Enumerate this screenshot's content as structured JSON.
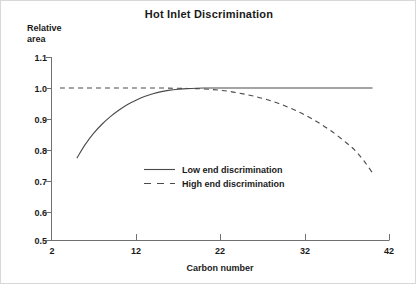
{
  "chart_data": {
    "type": "line",
    "title": "Hot Inlet Discrimination",
    "xlabel": "Carbon number",
    "ylabel": "Relative area",
    "ylabel_line1": "Relative",
    "ylabel_line2": "area",
    "xlim": [
      2,
      42
    ],
    "ylim": [
      0.5,
      1.1
    ],
    "xticks": [
      2,
      12,
      22,
      32,
      42
    ],
    "xtick_labels": [
      "2",
      "12",
      "22",
      "32",
      "42"
    ],
    "yticks": [
      0.5,
      0.6,
      0.7,
      0.8,
      0.9,
      1.0,
      1.1
    ],
    "ytick_labels": [
      "0.5",
      "0.6",
      "0.7",
      "0.8",
      "0.9",
      "1.0",
      "1.1"
    ],
    "grid": false,
    "legend_position": "center",
    "series": [
      {
        "name": "Low end discrimination",
        "style": "solid",
        "color": "#4a4a4a",
        "x": [
          5,
          6,
          7,
          8,
          9,
          10,
          11,
          12,
          13,
          14,
          15,
          16,
          17,
          18,
          20,
          22,
          25,
          28,
          31,
          34,
          37,
          40
        ],
        "y": [
          0.77,
          0.815,
          0.852,
          0.882,
          0.907,
          0.928,
          0.946,
          0.96,
          0.972,
          0.981,
          0.988,
          0.993,
          0.996,
          0.998,
          1.0,
          1.0,
          1.0,
          1.0,
          1.0,
          1.0,
          1.0,
          1.0
        ]
      },
      {
        "name": "High end discrimination",
        "style": "dashed",
        "color": "#4a4a4a",
        "x": [
          3,
          6,
          9,
          12,
          15,
          17,
          19,
          21,
          23,
          25,
          27,
          29,
          31,
          33,
          35,
          37,
          38,
          39,
          40
        ],
        "y": [
          1.0,
          1.0,
          1.0,
          1.0,
          1.0,
          0.999,
          0.998,
          0.995,
          0.989,
          0.979,
          0.966,
          0.948,
          0.925,
          0.896,
          0.861,
          0.818,
          0.793,
          0.76,
          0.721
        ]
      }
    ]
  },
  "legend": {
    "items": [
      {
        "label": "Low end discrimination",
        "style": "solid"
      },
      {
        "label": "High end discrimination",
        "style": "dashed"
      }
    ]
  }
}
